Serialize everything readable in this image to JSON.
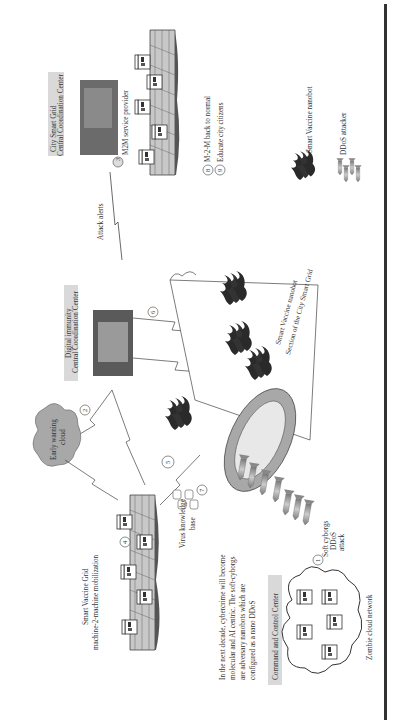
{
  "figure": {
    "orientation": "rotated-90-ccw",
    "labels": {
      "city_smart_grid_line1": "City Smart Grid",
      "city_smart_grid_line2": "Central Coordination Center",
      "m2m_service_provider": "M2M service provider",
      "attack_alerts": "Attack alerts",
      "digital_immunity_line1": "Digital immunity",
      "digital_immunity_line2": "Central Coordination Center",
      "early_warning_line1": "Early warning",
      "early_warning_line2": "cloud",
      "smart_vaccine_grid_line1": "Smart Vaccine Grid",
      "smart_vaccine_grid_line2": "machine-2-machine mobilization",
      "virus_kb_line1": "Virus knowledge",
      "virus_kb_line2": "base",
      "cybercrime_line1": "In the next decade, cybercrime will become",
      "cybercrime_line2": "molecular and AI centric. The soft-cyborgs",
      "cybercrime_line3": "are adversary nanobots which are",
      "cybercrime_line4": "configured as a nano DDoS",
      "command_control": "Command and Control Center",
      "zombie_network": "Zombie cloud network",
      "soft_cyborgs_line1": "Soft cyborgs",
      "soft_cyborgs_line2": "DDoS",
      "soft_cyborgs_line3": "attack",
      "tube_label1": "Smart Vaccine nanobot",
      "tube_label2": "Section of the City Smart Grid",
      "step8": "M-2-M back to normal",
      "step9": "Educate city citizens",
      "legend_nanobot": "Smart Vaccine nanobot",
      "legend_ddos": "DDoS attacker"
    },
    "steps": [
      "1",
      "2",
      "3",
      "4",
      "5",
      "6",
      "7",
      "8",
      "9"
    ],
    "colors": {
      "label_box": "#d9d9d9",
      "tube_ring": "#a8a8a8",
      "tube_inner": "#e8e8e8",
      "nanobot": "#2a2a2a",
      "missile": "#9a9a9a",
      "grid_fill": "#c8c8c8",
      "rule": "#333333"
    }
  }
}
